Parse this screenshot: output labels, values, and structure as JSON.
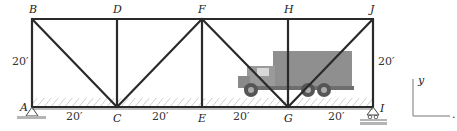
{
  "diagram": {
    "type": "truss",
    "nodes": {
      "A": "A",
      "B": "B",
      "C": "C",
      "D": "D",
      "E": "E",
      "F": "F",
      "G": "G",
      "H": "H",
      "I": "I",
      "J": "J"
    },
    "dimensions": {
      "height_left": "20′",
      "height_right": "20′",
      "panel_AC": "20′",
      "panel_CE": "20′",
      "panel_EG": "20′",
      "panel_GI": "20′"
    },
    "axes": {
      "y_label": "y",
      "x_label": "."
    },
    "colors": {
      "member": "#2a2a2a",
      "truck_body": "#8f8f8f",
      "deck_hatch": "#9a9a9a",
      "ground": "#b5b5b5"
    },
    "load": "truck-on-deck"
  }
}
